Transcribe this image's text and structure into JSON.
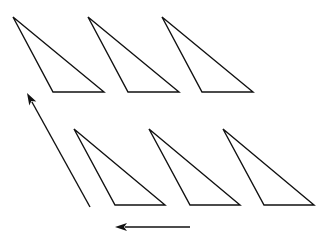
{
  "diagram": {
    "background": "#ffffff",
    "stroke_color": "#111111",
    "triangles": [
      {
        "row": "top",
        "index": 1,
        "points": [
          [
            13,
            17
          ],
          [
            53,
            92
          ],
          [
            104,
            92
          ]
        ]
      },
      {
        "row": "top",
        "index": 2,
        "points": [
          [
            88,
            17
          ],
          [
            128,
            92
          ],
          [
            179,
            92
          ]
        ]
      },
      {
        "row": "top",
        "index": 3,
        "points": [
          [
            162,
            17
          ],
          [
            202,
            92
          ],
          [
            253,
            92
          ]
        ]
      },
      {
        "row": "bottom",
        "index": 1,
        "points": [
          [
            74,
            129
          ],
          [
            115,
            205
          ],
          [
            165,
            205
          ]
        ]
      },
      {
        "row": "bottom",
        "index": 2,
        "points": [
          [
            149,
            129
          ],
          [
            190,
            205
          ],
          [
            240,
            205
          ]
        ]
      },
      {
        "row": "bottom",
        "index": 3,
        "points": [
          [
            223,
            129
          ],
          [
            264,
            205
          ],
          [
            314,
            205
          ]
        ]
      }
    ],
    "arrows": [
      {
        "name": "diagonal-up-arrow",
        "from": [
          90,
          207
        ],
        "to": [
          27,
          93
        ]
      },
      {
        "name": "left-arrow",
        "from": [
          190,
          227
        ],
        "to": [
          115,
          227
        ]
      }
    ]
  }
}
